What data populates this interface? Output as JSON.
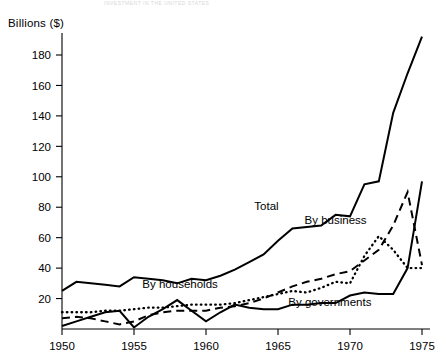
{
  "figure": {
    "cropped_title_remnant": "INVESTMENT IN THE UNITED STATES",
    "ylabel": "Billions ($)"
  },
  "chart_data": {
    "type": "line",
    "title": "",
    "xlabel": "",
    "ylabel": "Billions ($)",
    "xlim": [
      1950,
      1975
    ],
    "ylim": [
      0,
      195
    ],
    "yticks": [
      20,
      40,
      60,
      80,
      100,
      120,
      140,
      160,
      180
    ],
    "xticks": [
      1950,
      1955,
      1960,
      1965,
      1970,
      1975
    ],
    "grid": false,
    "legend": "inline-annotations",
    "x": [
      1950,
      1951,
      1952,
      1953,
      1954,
      1955,
      1956,
      1957,
      1958,
      1959,
      1960,
      1961,
      1962,
      1963,
      1964,
      1965,
      1966,
      1967,
      1968,
      1969,
      1970,
      1971,
      1972,
      1973,
      1974,
      1975
    ],
    "series": [
      {
        "name": "Total",
        "style": "solid",
        "label": "Total",
        "values": [
          25,
          31,
          30,
          29,
          28,
          34,
          33,
          32,
          30,
          33,
          32,
          35,
          39,
          44,
          49,
          58,
          66,
          67,
          68,
          75,
          74,
          95,
          97,
          142,
          168,
          192
        ]
      },
      {
        "name": "By business",
        "style": "dashed",
        "label": "By business",
        "values": [
          7,
          8,
          7,
          5,
          3,
          5,
          9,
          11,
          12,
          12,
          12,
          14,
          15,
          17,
          20,
          24,
          28,
          31,
          33,
          36,
          38,
          45,
          52,
          68,
          90,
          42
        ]
      },
      {
        "name": "By households",
        "style": "dotted",
        "label": "By households",
        "values": [
          11,
          11,
          11,
          12,
          12,
          13,
          14,
          14,
          15,
          16,
          16,
          16,
          17,
          19,
          21,
          23,
          25,
          24,
          27,
          31,
          30,
          48,
          61,
          52,
          40,
          40
        ]
      },
      {
        "name": "By governments",
        "style": "solid",
        "label": "By governments",
        "values": [
          2,
          5,
          8,
          11,
          12,
          1,
          8,
          13,
          19,
          12,
          5,
          11,
          16,
          14,
          13,
          13,
          16,
          16,
          17,
          17,
          22,
          24,
          23,
          23,
          40,
          97
        ]
      }
    ],
    "annotations": [
      {
        "text": "Total",
        "x": 1964.2,
        "y": 78
      },
      {
        "text": "By business",
        "x": 1969.0,
        "y": 69
      },
      {
        "text": "By households",
        "x": 1958.2,
        "y": 27
      },
      {
        "text": "By governments",
        "x": 1968.6,
        "y": 15
      }
    ]
  },
  "axes": {
    "ytick_labels": [
      "180",
      "160",
      "140",
      "120",
      "100",
      "80",
      "60",
      "40",
      "20"
    ],
    "xtick_labels": [
      "1950",
      "1955",
      "1960",
      "1965",
      "1970",
      "1975"
    ]
  }
}
